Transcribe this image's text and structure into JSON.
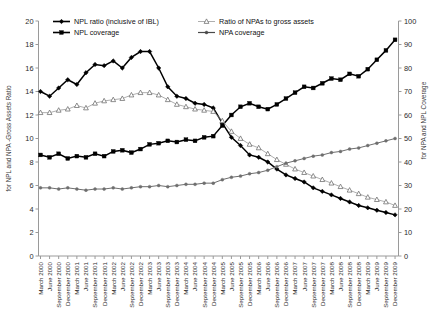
{
  "chart_data": {
    "type": "line",
    "title": "",
    "xlabel": "",
    "ylabel": "for NPL and NPA -Gross Assets Ratio",
    "y2label": "for NPA and NPL Coverage",
    "ylim": [
      0,
      20
    ],
    "y2lim": [
      0,
      100
    ],
    "yticks": [
      0,
      2,
      4,
      6,
      8,
      10,
      12,
      14,
      16,
      18,
      20
    ],
    "y2ticks": [
      0,
      10,
      20,
      30,
      40,
      50,
      60,
      70,
      80,
      90,
      100
    ],
    "grid": false,
    "legend_position": "top",
    "categories": [
      "March 2000",
      "June 2000",
      "September 2000",
      "December 2000",
      "March 2001",
      "June 2001",
      "September 2001",
      "December 2001",
      "March 2002",
      "June 2002",
      "September 2002",
      "December 2002",
      "March 2003",
      "June 2003",
      "September 2003",
      "December 2003",
      "March 2004",
      "June 2004",
      "September 2004",
      "December 2004",
      "March 2005",
      "June 2005",
      "September 2005",
      "December 2005",
      "March 2006",
      "June 2006",
      "September 2006",
      "December 2006",
      "March 2007",
      "June 2007",
      "September 2007",
      "December 2007",
      "March 2008",
      "June 2008",
      "September 2008",
      "December 2008",
      "March 2009",
      "June 2009",
      "September 2009",
      "December 2009"
    ],
    "series": [
      {
        "name": "NPL ratio (inclusive of IBL)",
        "axis": "left",
        "marker": "filled-diamond",
        "color": "#000000",
        "values": [
          14.0,
          13.6,
          14.3,
          15.0,
          14.6,
          15.6,
          16.3,
          16.2,
          16.6,
          16.0,
          16.9,
          17.4,
          17.4,
          16.0,
          14.4,
          13.6,
          13.4,
          13.0,
          12.9,
          12.6,
          11.3,
          10.1,
          9.4,
          8.6,
          8.4,
          8.0,
          7.4,
          6.9,
          6.6,
          6.3,
          5.8,
          5.5,
          5.2,
          4.9,
          4.6,
          4.3,
          4.1,
          3.9,
          3.7,
          3.5
        ]
      },
      {
        "name": "NPL coverage",
        "axis": "right",
        "marker": "filled-square",
        "color": "#000000",
        "values": [
          43.0,
          42.0,
          43.5,
          41.5,
          42.5,
          42.0,
          43.5,
          42.5,
          44.5,
          45.0,
          44.0,
          45.5,
          47.5,
          48.0,
          49.0,
          48.5,
          49.5,
          49.0,
          50.5,
          51.0,
          55.5,
          60.0,
          63.5,
          65.0,
          63.5,
          62.5,
          64.5,
          67.0,
          69.5,
          72.0,
          71.5,
          73.5,
          75.5,
          75.0,
          77.5,
          76.5,
          79.5,
          83.5,
          87.5,
          92.0
        ]
      },
      {
        "name": "Ratio of NPAs to gross assets",
        "axis": "left",
        "marker": "open-triangle",
        "color": "#9a9a9a",
        "values": [
          12.2,
          12.2,
          12.4,
          12.5,
          12.8,
          12.6,
          13.0,
          13.2,
          13.3,
          13.4,
          13.7,
          13.9,
          13.9,
          13.7,
          13.3,
          12.9,
          12.7,
          12.5,
          12.4,
          12.3,
          11.5,
          10.6,
          10.0,
          9.5,
          9.2,
          8.7,
          8.2,
          7.8,
          7.4,
          7.1,
          6.8,
          6.5,
          6.2,
          5.9,
          5.6,
          5.3,
          5.0,
          4.8,
          4.6,
          4.3
        ]
      },
      {
        "name": "NPA coverage",
        "axis": "right",
        "marker": "filled-circle-small",
        "color": "#6e6e6e",
        "values": [
          29.0,
          29.0,
          28.5,
          29.0,
          28.5,
          28.0,
          28.5,
          28.5,
          29.0,
          28.5,
          29.0,
          29.5,
          29.5,
          30.0,
          29.5,
          30.0,
          30.5,
          30.5,
          31.0,
          31.0,
          32.5,
          33.5,
          34.0,
          35.0,
          35.5,
          36.5,
          38.0,
          39.5,
          40.5,
          41.5,
          42.5,
          43.0,
          44.0,
          44.5,
          45.5,
          46.0,
          47.0,
          48.0,
          49.0,
          50.0
        ]
      }
    ],
    "legend": [
      "NPL ratio (inclusive of IBL)",
      "NPL coverage",
      "Ratio of NPAs to gross assets",
      "NPA coverage"
    ]
  },
  "colors": {
    "primary": "#000000",
    "secondary": "#9a9a9a",
    "tertiary": "#6e6e6e",
    "axis": "#9a9a9a",
    "background": "#ffffff"
  }
}
